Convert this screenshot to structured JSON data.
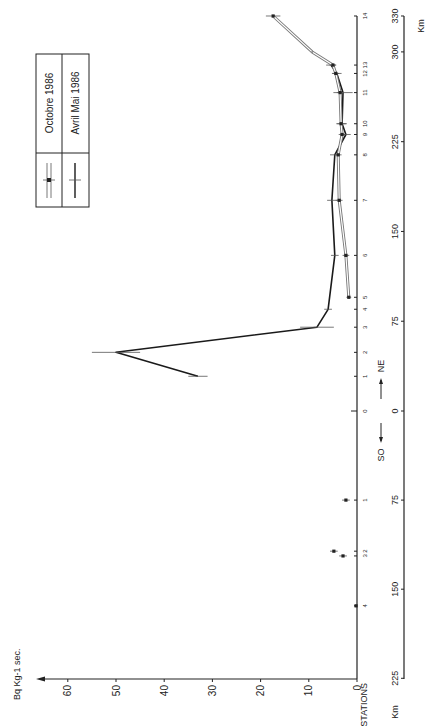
{
  "chart_data": {
    "type": "line",
    "orientation": "rotated-90-ccw",
    "ylabel": "Bq Kg-1 sec.",
    "xlabel": "Km",
    "station_axis_label": "STATIONS",
    "direction_labels": {
      "left": "SO",
      "right": "NE"
    },
    "value_ticks": [
      0,
      10,
      20,
      30,
      40,
      50,
      60
    ],
    "ylim": [
      0,
      65
    ],
    "km_ticks_ne": [
      0,
      75,
      150,
      225,
      300,
      330
    ],
    "km_ticks_so": [
      75,
      150,
      225
    ],
    "stations_ne": [
      {
        "label": "0",
        "km": 0
      },
      {
        "label": "1",
        "km": 29
      },
      {
        "label": "2",
        "km": 49
      },
      {
        "label": "3",
        "km": 70
      },
      {
        "label": "4",
        "km": 85
      },
      {
        "label": "5",
        "km": 95
      },
      {
        "label": "6",
        "km": 130
      },
      {
        "label": "7",
        "km": 176
      },
      {
        "label": "8",
        "km": 214
      },
      {
        "label": "9",
        "km": 231
      },
      {
        "label": "10",
        "km": 240
      },
      {
        "label": "11",
        "km": 266
      },
      {
        "label": "12",
        "km": 282
      },
      {
        "label": "13",
        "km": 289
      },
      {
        "label": "14",
        "km": 330
      }
    ],
    "stations_so": [
      {
        "label": "1",
        "km": 75
      },
      {
        "label": "2",
        "km": 118
      },
      {
        "label": "3",
        "km": 122
      },
      {
        "label": "4",
        "km": 164
      }
    ],
    "series": [
      {
        "name": "Avril Mai 1986",
        "style": "solid-black",
        "side": "NE",
        "points": [
          {
            "station": "1",
            "km": 29,
            "value": 33,
            "err": 2
          },
          {
            "station": "2",
            "km": 49,
            "value": 50,
            "err": 5
          },
          {
            "station": "3",
            "km": 70,
            "value": 8.3,
            "err": 3.5
          },
          {
            "station": "4",
            "km": 85,
            "value": 6.0,
            "err": 0.8
          },
          {
            "station": "6",
            "km": 130,
            "value": 4.6,
            "err": 0.8
          },
          {
            "station": "7",
            "km": 176,
            "value": 5.2,
            "err": 1.0
          },
          {
            "station": "8",
            "km": 214,
            "value": 4.6,
            "err": 1.0
          },
          {
            "station": "9",
            "km": 231,
            "value": 2.3,
            "err": 1.0
          },
          {
            "station": "10",
            "km": 240,
            "value": 3.1,
            "err": 1.0
          },
          {
            "station": "11",
            "km": 266,
            "value": 2.9,
            "err": 2.0
          },
          {
            "station": "12",
            "km": 282,
            "value": 4.2,
            "err": 1.0
          },
          {
            "station": "13",
            "km": 289,
            "value": 5.4,
            "err": 1.0
          }
        ]
      },
      {
        "name": "Octobre 1986",
        "style": "double-line",
        "side": "NE",
        "points": [
          {
            "station": "5",
            "km": 95,
            "value": 1.7,
            "err": 0.5
          },
          {
            "station": "6",
            "km": 130,
            "value": 2.3,
            "err": 0.7
          },
          {
            "station": "7",
            "km": 176,
            "value": 3.7,
            "err": 0.7
          },
          {
            "station": "8",
            "km": 214,
            "value": 3.9,
            "err": 0.7
          },
          {
            "station": "9",
            "km": 231,
            "value": 3.1,
            "err": 0.7
          },
          {
            "station": "10",
            "km": 240,
            "value": 3.3,
            "err": 1.0
          },
          {
            "station": "11",
            "km": 266,
            "value": 3.5,
            "err": 0.7
          },
          {
            "station": "12",
            "km": 282,
            "value": 4.4,
            "err": 0.7
          },
          {
            "station": "13",
            "km": 289,
            "value": 5.0,
            "err": 0.7
          },
          {
            "station": "",
            "km": 300,
            "value": 9.3,
            "err": 0
          },
          {
            "station": "14",
            "km": 330,
            "value": 17.4,
            "err": 1.5
          }
        ]
      },
      {
        "name": "Octobre 1986",
        "style": "isolated-points",
        "side": "SO",
        "points": [
          {
            "station": "1",
            "km": 75,
            "value": 2.3,
            "err": 0.8
          },
          {
            "station": "2",
            "km": 118,
            "value": 4.8,
            "err": 0.8
          },
          {
            "station": "3",
            "km": 122,
            "value": 2.9,
            "err": 0.8
          },
          {
            "station": "4",
            "km": 164,
            "value": 0.2,
            "err": 0.3
          }
        ]
      }
    ],
    "legend": {
      "position": "upper-left",
      "entries": [
        {
          "label": "Octobre 1986",
          "symbol": "double-line-with-marker"
        },
        {
          "label": "Avril Mai 1986",
          "symbol": "single-line"
        }
      ]
    },
    "grid": false
  },
  "labels": {
    "value_axis": "Bq Kg-1 sec.",
    "km_axis": "Km",
    "stations": "STATIONS",
    "so": "SO",
    "ne": "NE",
    "legend_oct": "Octobre 1986",
    "legend_avril": "Avril Mai 1986"
  }
}
